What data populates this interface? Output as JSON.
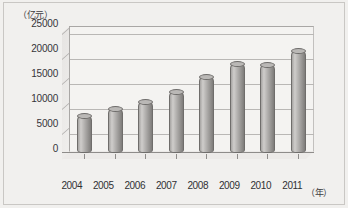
{
  "chart_data": {
    "type": "bar",
    "title": "",
    "subtitle": "",
    "xlabel": "（年）",
    "ylabel": "（亿元）",
    "categories": [
      "2004",
      "2005",
      "2006",
      "2007",
      "2008",
      "2009",
      "2010",
      "2011"
    ],
    "values": [
      7500,
      8900,
      10400,
      12300,
      15300,
      18000,
      17700,
      20600
    ],
    "series": [
      {
        "name": "",
        "values": [
          7500,
          8900,
          10400,
          12300,
          15300,
          18000,
          17700,
          20600
        ]
      }
    ],
    "ylim": [
      0,
      25000
    ],
    "y_ticks": [
      0,
      5000,
      10000,
      15000,
      20000,
      25000
    ],
    "y_tick_labels": [
      "0",
      "5000",
      "10000",
      "15000",
      "20000",
      "25000"
    ],
    "grid": true,
    "legend": false,
    "legend_position": "none",
    "style": "3d-cylinder",
    "bar_color": "#b0aeac",
    "grid_color": "#b9b7b5",
    "background_color": "#f1f0ee",
    "annotations": []
  },
  "axes": {
    "y_unit_caption": "（亿元）",
    "x_unit_caption": "（年）"
  }
}
